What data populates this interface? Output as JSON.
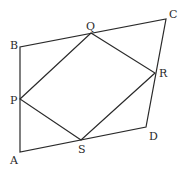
{
  "diagram": {
    "type": "geometry",
    "points": {
      "A": {
        "label": "A",
        "x": 20,
        "y": 152
      },
      "B": {
        "label": "B",
        "x": 20,
        "y": 47
      },
      "C": {
        "label": "C",
        "x": 166,
        "y": 19
      },
      "D": {
        "label": "D",
        "x": 146,
        "y": 127
      },
      "P": {
        "label": "P",
        "x": 20,
        "y": 99
      },
      "Q": {
        "label": "Q",
        "x": 91,
        "y": 33
      },
      "R": {
        "label": "R",
        "x": 155,
        "y": 73
      },
      "S": {
        "label": "S",
        "x": 81,
        "y": 140
      }
    },
    "outer_polygon": [
      "A",
      "B",
      "C",
      "D"
    ],
    "inner_polygon": [
      "P",
      "Q",
      "R",
      "S"
    ],
    "stroke_color": "#2a2a2a",
    "background": "#ffffff"
  }
}
